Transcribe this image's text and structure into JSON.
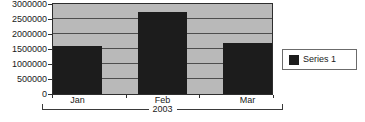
{
  "chart_data": {
    "type": "bar",
    "title": "",
    "categories": [
      "Jan",
      "Feb",
      "Mar"
    ],
    "series": [
      {
        "name": "Series 1",
        "values": [
          1600000,
          2740000,
          1700000
        ]
      }
    ],
    "xlabel": "2003",
    "ylabel": "",
    "ylim": [
      0,
      3000000
    ],
    "ytick_step": 500000,
    "ytick_labels": [
      "0",
      "500000",
      "1000000",
      "1500000",
      "2000000",
      "2500000",
      "3000000"
    ],
    "grid": true,
    "legend_position": "right",
    "colors": {
      "bar": "#1c1c1c",
      "plot_background": "#b9b9b9",
      "gridline": "#4d4d4d",
      "border": "#2e2e2e",
      "page_background": "#ffffff"
    }
  }
}
